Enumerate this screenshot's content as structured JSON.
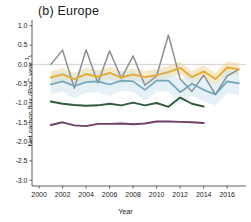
{
  "panel": {
    "title": "(b) Europe"
  },
  "axes": {
    "xlabel": "Year",
    "ylabel_main": "Net carbon flux",
    "ylabel_units": "(Pg C year",
    "ylabel_exponent": "-1",
    "ylabel_units_close": ")",
    "xticks": [
      "2000",
      "2002",
      "2004",
      "2006",
      "2008",
      "2010",
      "2012",
      "2014",
      "2016"
    ],
    "yticks": [
      "1.0",
      "0.5",
      "0.0",
      "-0.5",
      "-1.0",
      "-1.5",
      "-2.0",
      "-2.5",
      "-3.0"
    ],
    "xlim": [
      1999.4,
      2017.6
    ],
    "ylim": [
      -3.15,
      1.15
    ],
    "zero_line": 0.0
  },
  "colors": {
    "grey": "#8c9096",
    "yellow": "#e5ac34",
    "yellow_band": "#f0d79a",
    "teal": "#6ea8bf",
    "teal_band": "#cfe6ef",
    "green": "#2f5a3c",
    "purple": "#6e3f6b",
    "axis": "#4d4d4d",
    "zero": "#bfbfbf",
    "text": "#1a1a1a"
  },
  "chart_data": {
    "type": "line",
    "title": "(b) Europe",
    "xlabel": "Year",
    "ylabel": "Net carbon flux (Pg C year-1)",
    "xlim": [
      1999.4,
      2017.6
    ],
    "ylim": [
      -3.15,
      1.15
    ],
    "grid": false,
    "legend": "none",
    "series": [
      {
        "name": "grey-series",
        "color": "#8c9096",
        "x": [
          2001,
          2002,
          2003,
          2004,
          2005,
          2006,
          2007,
          2008,
          2009,
          2010,
          2011,
          2012,
          2013,
          2014,
          2015,
          2016,
          2017
        ],
        "values": [
          0.0,
          0.37,
          -0.62,
          0.38,
          -0.48,
          0.35,
          -0.36,
          0.22,
          -0.54,
          -0.3,
          0.76,
          -0.38,
          -0.7,
          -0.28,
          -0.78,
          -0.3,
          -0.12
        ]
      },
      {
        "name": "yellow-series",
        "color": "#e5ac34",
        "band_color": "#f0d79a",
        "x": [
          2001,
          2002,
          2003,
          2004,
          2005,
          2006,
          2007,
          2008,
          2009,
          2010,
          2011,
          2012,
          2013,
          2014,
          2015,
          2016,
          2017
        ],
        "values": [
          -0.34,
          -0.26,
          -0.38,
          -0.25,
          -0.32,
          -0.22,
          -0.34,
          -0.26,
          -0.33,
          -0.28,
          -0.2,
          -0.09,
          -0.33,
          -0.18,
          -0.38,
          -0.08,
          -0.13
        ],
        "band_lower": [
          -0.5,
          -0.42,
          -0.54,
          -0.41,
          -0.48,
          -0.38,
          -0.5,
          -0.42,
          -0.49,
          -0.44,
          -0.36,
          -0.25,
          -0.49,
          -0.34,
          -0.54,
          -0.24,
          -0.29
        ],
        "band_upper": [
          -0.18,
          -0.1,
          -0.22,
          -0.09,
          -0.16,
          -0.06,
          -0.18,
          -0.1,
          -0.17,
          -0.12,
          -0.04,
          0.07,
          -0.17,
          -0.02,
          -0.22,
          0.08,
          0.03
        ]
      },
      {
        "name": "teal-series",
        "color": "#6ea8bf",
        "band_color": "#cfe6ef",
        "x": [
          2001,
          2002,
          2003,
          2004,
          2005,
          2006,
          2007,
          2008,
          2009,
          2010,
          2011,
          2012,
          2013,
          2014,
          2015,
          2016,
          2017
        ],
        "values": [
          -0.52,
          -0.44,
          -0.56,
          -0.46,
          -0.44,
          -0.52,
          -0.42,
          -0.44,
          -0.66,
          -0.42,
          -0.42,
          -0.72,
          -0.5,
          -0.66,
          -0.78,
          -0.44,
          -0.49
        ],
        "band_lower": [
          -0.78,
          -0.7,
          -0.88,
          -0.74,
          -0.72,
          -0.82,
          -0.68,
          -0.72,
          -0.94,
          -0.7,
          -0.7,
          -1.04,
          -0.8,
          -0.96,
          -1.06,
          -0.74,
          -0.8
        ],
        "band_upper": [
          -0.26,
          -0.18,
          -0.26,
          -0.2,
          -0.18,
          -0.24,
          -0.18,
          -0.18,
          -0.38,
          -0.16,
          -0.16,
          -0.42,
          -0.22,
          -0.38,
          -0.5,
          -0.16,
          -0.2
        ]
      },
      {
        "name": "green-series",
        "color": "#2f5a3c",
        "x": [
          2001,
          2002,
          2003,
          2004,
          2005,
          2006,
          2007,
          2008,
          2009,
          2010,
          2011,
          2012,
          2013,
          2014
        ],
        "values": [
          -0.96,
          -1.02,
          -1.05,
          -1.07,
          -1.06,
          -1.02,
          -1.06,
          -0.99,
          -1.06,
          -1.0,
          -1.1,
          -0.86,
          -1.02,
          -1.09
        ]
      },
      {
        "name": "purple-series",
        "color": "#6e3f6b",
        "x": [
          2001,
          2002,
          2003,
          2004,
          2005,
          2006,
          2007,
          2008,
          2009,
          2010,
          2011,
          2012,
          2013,
          2014
        ],
        "values": [
          -1.57,
          -1.5,
          -1.58,
          -1.6,
          -1.54,
          -1.54,
          -1.53,
          -1.55,
          -1.53,
          -1.48,
          -1.48,
          -1.49,
          -1.5,
          -1.52
        ]
      }
    ]
  }
}
